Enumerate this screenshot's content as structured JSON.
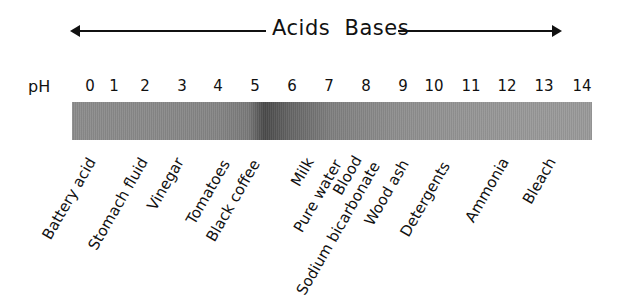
{
  "title": {
    "acids_bases": "Acids  Bases"
  },
  "axis": {
    "label": "pH",
    "ticks": [
      "0",
      "1",
      "2",
      "3",
      "4",
      "5",
      "6",
      "7",
      "8",
      "9",
      "10",
      "11",
      "12",
      "13",
      "14"
    ]
  },
  "substances": [
    {
      "name": "Battery acid",
      "ph": 0
    },
    {
      "name": "Stomach fluid",
      "ph": 1.5
    },
    {
      "name": "Vinegar",
      "ph": 2.5
    },
    {
      "name": "Tomatoes",
      "ph": 4
    },
    {
      "name": "Black coffee",
      "ph": 5
    },
    {
      "name": "Milk",
      "ph": 6.5
    },
    {
      "name": "Pure water",
      "ph": 7
    },
    {
      "name": "Blood",
      "ph": 7.5
    },
    {
      "name": "Sodium bicarbonate",
      "ph": 8
    },
    {
      "name": "Wood ash",
      "ph": 9
    },
    {
      "name": "Detergents",
      "ph": 10
    },
    {
      "name": "Ammonia",
      "ph": 11.5
    },
    {
      "name": "Bleach",
      "ph": 13
    }
  ],
  "colors": {
    "line": "#111111",
    "bar_base": "#8c8c8c",
    "bar_dark_band": "#4a4a4a"
  }
}
